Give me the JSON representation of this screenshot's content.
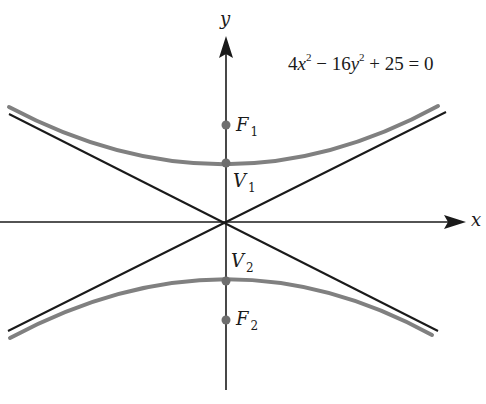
{
  "equation": {
    "text": "4x² − 16y² + 25 = 0",
    "parts": [
      "4",
      "x",
      "2",
      " − 16",
      "y",
      "2",
      " + 25 = 0"
    ]
  },
  "axes": {
    "x_label": "x",
    "y_label": "y"
  },
  "points": {
    "F1": {
      "letter": "F",
      "sub": "1"
    },
    "V1": {
      "letter": "V",
      "sub": "1"
    },
    "V2": {
      "letter": "V",
      "sub": "2"
    },
    "F2": {
      "letter": "F",
      "sub": "2"
    }
  },
  "colors": {
    "curve": "#808080",
    "asymptote": "#1a1a1a",
    "axis": "#1a1a1a",
    "point": "#6e6e6e"
  }
}
